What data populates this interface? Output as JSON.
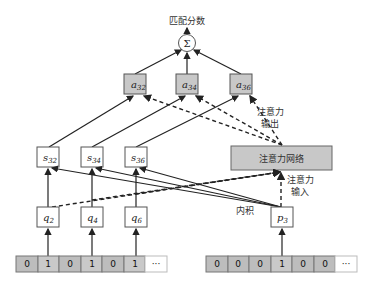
{
  "title": "匹配分数",
  "sum_symbol": "Σ",
  "a_nodes": [
    {
      "base": "a",
      "sub": "32"
    },
    {
      "base": "a",
      "sub": "34"
    },
    {
      "base": "a",
      "sub": "36"
    }
  ],
  "s_nodes": [
    {
      "base": "s",
      "sub": "32"
    },
    {
      "base": "s",
      "sub": "34"
    },
    {
      "base": "s",
      "sub": "36"
    }
  ],
  "q_nodes": [
    {
      "base": "q",
      "sub": "2"
    },
    {
      "base": "q",
      "sub": "4"
    },
    {
      "base": "q",
      "sub": "6"
    }
  ],
  "p_node": {
    "base": "p",
    "sub": "3"
  },
  "attention_network": "注意力网络",
  "attention_output_label": [
    "注意力",
    "输出"
  ],
  "attention_input_label": [
    "注意力",
    "输入"
  ],
  "inner_product_label": "内积",
  "left_vector": [
    "0",
    "1",
    "0",
    "1",
    "0",
    "1",
    "···"
  ],
  "right_vector": [
    "0",
    "0",
    "0",
    "1",
    "0",
    "0",
    "···"
  ],
  "colors": {
    "box_gray": "#c8c8c8",
    "cell_gray": "#bdbdbd",
    "line": "#222222"
  }
}
